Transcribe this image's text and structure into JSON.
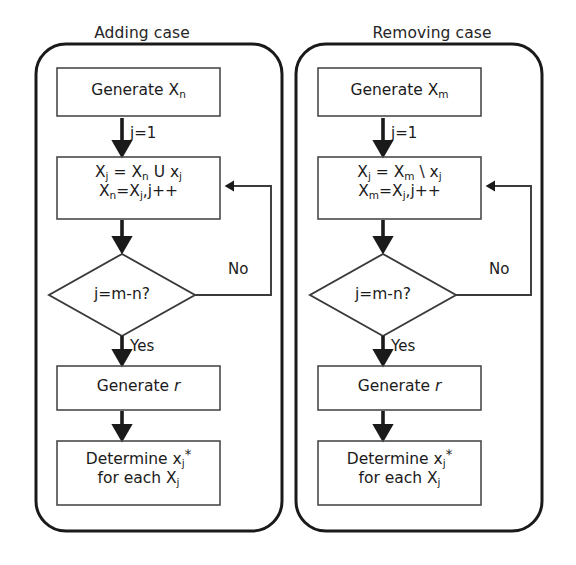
{
  "figure": {
    "type": "flowchart",
    "orientation": "two side-by-side panels",
    "background_color": "#ffffff",
    "line_color": "#1a1a1a",
    "text_color": "#1b1b1b"
  },
  "panels": [
    {
      "id": "adding",
      "title": "Adding case",
      "nodes": [
        {
          "id": "gen-xn",
          "shape": "process",
          "text": "Generate Xₙ",
          "label_plain": "Generate Xn"
        },
        {
          "id": "union",
          "shape": "process",
          "line1": "Xⱼ = Xₙ U xⱼ",
          "line2": "Xₙ=Xⱼ,j++",
          "label_plain": "Xj = Xn U xj ; Xn=Xj,j++"
        },
        {
          "id": "decision",
          "shape": "decision",
          "text": "j=m-n?",
          "label_plain": "j=m-n?"
        },
        {
          "id": "gen-r",
          "shape": "process",
          "text": "Generate r",
          "label_plain": "Generate r",
          "italic_tail": "r"
        },
        {
          "id": "determine",
          "shape": "process",
          "line1": "Determine xⱼ*",
          "line2": "for each Xⱼ",
          "label_plain": "Determine xj* for each Xj"
        }
      ],
      "edges": [
        {
          "from": "gen-xn",
          "to": "union",
          "label": "j=1",
          "kind": "straight-down"
        },
        {
          "from": "union",
          "to": "decision",
          "label": "",
          "kind": "straight-down"
        },
        {
          "from": "decision",
          "to": "union",
          "label": "No",
          "kind": "loop-right-up"
        },
        {
          "from": "decision",
          "to": "gen-r",
          "label": "Yes",
          "kind": "straight-down"
        },
        {
          "from": "gen-r",
          "to": "determine",
          "label": "",
          "kind": "straight-down"
        }
      ]
    },
    {
      "id": "removing",
      "title": "Removing case",
      "nodes": [
        {
          "id": "gen-xm",
          "shape": "process",
          "text": "Generate Xₘ",
          "label_plain": "Generate Xm"
        },
        {
          "id": "difference",
          "shape": "process",
          "line1": "Xⱼ = Xₘ \\ xⱼ",
          "line2": "Xₘ=Xⱼ,j++",
          "label_plain": "Xj = Xm \\ xj ; Xm=Xj,j++"
        },
        {
          "id": "decision",
          "shape": "decision",
          "text": "j=m-n?",
          "label_plain": "j=m-n?"
        },
        {
          "id": "gen-r",
          "shape": "process",
          "text": "Generate r",
          "label_plain": "Generate r",
          "italic_tail": "r"
        },
        {
          "id": "determine",
          "shape": "process",
          "line1": "Determine xⱼ*",
          "line2": "for each Xⱼ",
          "label_plain": "Determine xj* for each Xj"
        }
      ],
      "edges": [
        {
          "from": "gen-xm",
          "to": "difference",
          "label": "j=1",
          "kind": "straight-down"
        },
        {
          "from": "difference",
          "to": "decision",
          "label": "",
          "kind": "straight-down"
        },
        {
          "from": "decision",
          "to": "difference",
          "label": "No",
          "kind": "loop-right-up"
        },
        {
          "from": "decision",
          "to": "gen-r",
          "label": "Yes",
          "kind": "straight-down"
        },
        {
          "from": "gen-r",
          "to": "determine",
          "label": "",
          "kind": "straight-down"
        }
      ]
    }
  ],
  "left": {
    "title": "Adding case",
    "n1": {
      "text": "Generate X",
      "sub": "n"
    },
    "n2": {
      "l1a": "X",
      "l1a_sub": "j",
      "l1b": " = X",
      "l1b_sub": "n",
      "l1c": " U x",
      "l1c_sub": "j",
      "l2a": "X",
      "l2a_sub": "n",
      "l2b": "=X",
      "l2b_sub": "j",
      "l2c": ",j++"
    },
    "n3": {
      "text": "j=m-n?"
    },
    "n4": {
      "text": "Generate ",
      "ital": "r"
    },
    "n5": {
      "l1": "Determine x",
      "l1_sub": "j",
      "l1_star": "*",
      "l2": "for each X",
      "l2_sub": "j"
    },
    "lbl_j1": "j=1",
    "lbl_no": "No",
    "lbl_yes": "Yes"
  },
  "right": {
    "title": "Removing case",
    "n1": {
      "text": "Generate X",
      "sub": "m"
    },
    "n2": {
      "l1a": "X",
      "l1a_sub": "j",
      "l1b": " = X",
      "l1b_sub": "m",
      "l1c": " \\ x",
      "l1c_sub": "j",
      "l2a": "X",
      "l2a_sub": "m",
      "l2b": "=X",
      "l2b_sub": "j",
      "l2c": ",j++"
    },
    "n3": {
      "text": "j=m-n?"
    },
    "n4": {
      "text": "Generate ",
      "ital": "r"
    },
    "n5": {
      "l1": "Determine x",
      "l1_sub": "j",
      "l1_star": "*",
      "l2": "for each X",
      "l2_sub": "j"
    },
    "lbl_j1": "j=1",
    "lbl_no": "No",
    "lbl_yes": "Yes"
  }
}
